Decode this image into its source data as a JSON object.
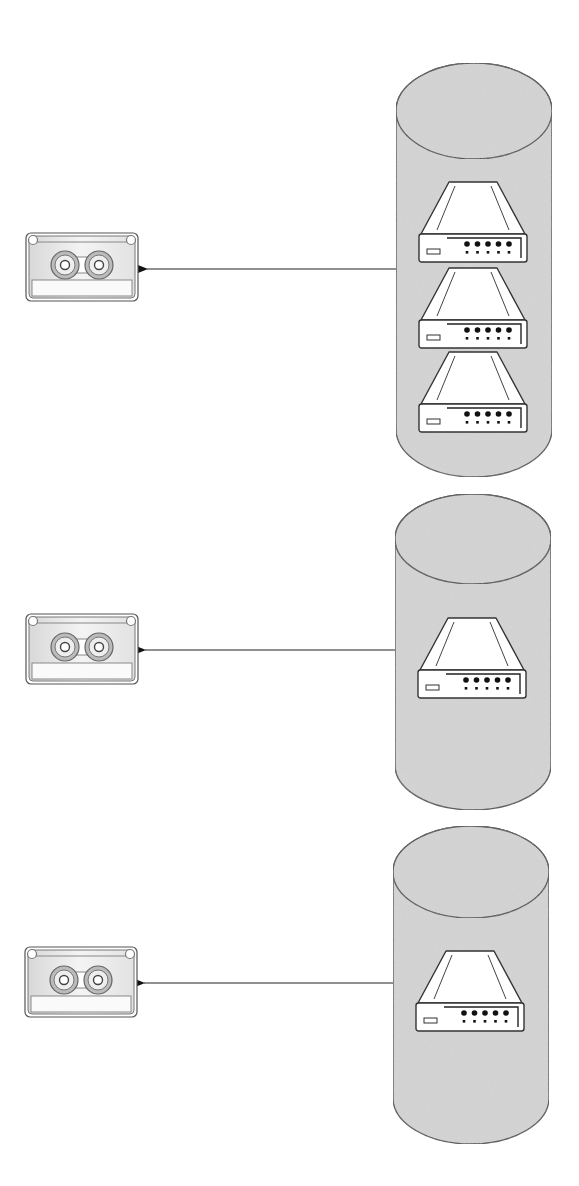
{
  "diagram": {
    "type": "network-diagram",
    "colors": {
      "background": "#ffffff",
      "cylinder_fill": "#d6d6d6",
      "stroke": "#3a3a3a",
      "device_fill": "#ffffff",
      "tape_fill": "#ececec"
    },
    "groups": [
      {
        "id": "group-1",
        "tape": {
          "icon": "tape-cassette-icon",
          "x": 26,
          "y": 233,
          "w": 112,
          "h": 68
        },
        "cylinder": {
          "x": 396,
          "top": 63,
          "bottom": 477,
          "width": 156,
          "cap_ry": 48
        },
        "devices": [
          {
            "icon": "network-device-icon",
            "cx": 473,
            "y": 180
          },
          {
            "icon": "network-device-icon",
            "cx": 473,
            "y": 266
          },
          {
            "icon": "network-device-icon",
            "cx": 473,
            "y": 350
          }
        ],
        "connector": {
          "from_x": 396,
          "to_x": 138,
          "y": 269,
          "arrow": "left"
        }
      },
      {
        "id": "group-2",
        "tape": {
          "icon": "tape-cassette-icon",
          "x": 26,
          "y": 614,
          "w": 112,
          "h": 70
        },
        "cylinder": {
          "x": 395,
          "top": 494,
          "bottom": 810,
          "width": 156,
          "cap_ry": 45
        },
        "devices": [
          {
            "icon": "network-device-icon",
            "cx": 472,
            "y": 616
          }
        ],
        "connector": {
          "from_x": 395,
          "to_x": 136,
          "y": 650,
          "arrow": "left"
        }
      },
      {
        "id": "group-3",
        "tape": {
          "icon": "tape-cassette-icon",
          "x": 25,
          "y": 947,
          "w": 112,
          "h": 70
        },
        "cylinder": {
          "x": 393,
          "top": 826,
          "bottom": 1144,
          "width": 156,
          "cap_ry": 46
        },
        "devices": [
          {
            "icon": "network-device-icon",
            "cx": 470,
            "y": 949
          }
        ],
        "connector": {
          "from_x": 393,
          "to_x": 135,
          "y": 983,
          "arrow": "left"
        }
      }
    ]
  }
}
